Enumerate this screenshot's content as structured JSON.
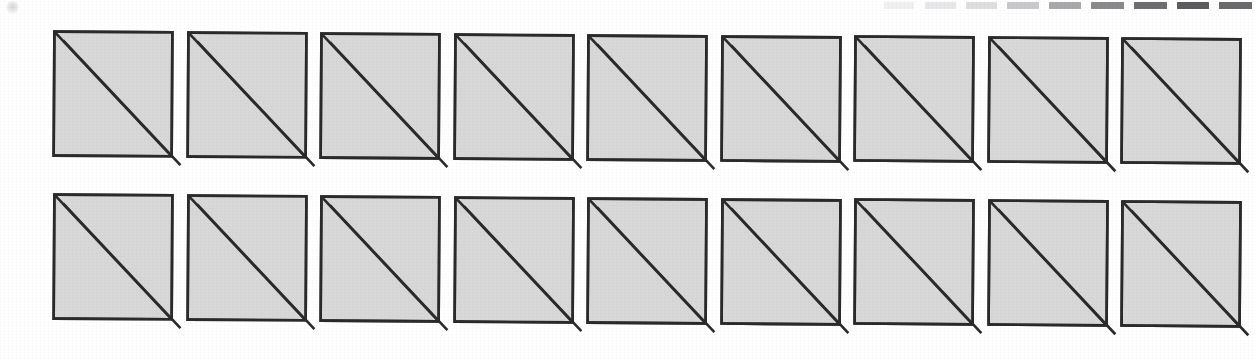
{
  "figure": {
    "background_color": "#ffffff",
    "width": 1255,
    "height": 359
  },
  "style": {
    "fill_color": "#d8d8d8",
    "stroke_color": "#2a2a2a",
    "band_color": "#ffffff",
    "stroke_width": 2.6,
    "band_width": 11
  },
  "grid": {
    "rows": 2,
    "columns": 9,
    "tile_count": 18,
    "tile_width": 118,
    "tile_height": 124,
    "column_pitch": 133.5,
    "row_top_offsets": [
      30,
      193
    ],
    "first_column_left": 52,
    "skew_per_column": 0.9,
    "skew_note": "Each successive tile sits fractionally lower and leans slightly, reproducing the page skew of the original scan."
  },
  "corner_mark": {
    "name": "registration-dot",
    "visible": true,
    "position": "top-left",
    "color": "#8e8e92"
  },
  "dash_strip": {
    "name": "tick-strip",
    "position": "top-right",
    "count": 10,
    "note": "Row of short horizontal dashes increasing in darkness toward the right edge.",
    "dashes": [
      {
        "left": 0,
        "width": 30,
        "color": "#f0f0f1"
      },
      {
        "left": 41,
        "width": 31,
        "color": "#e8e8ea"
      },
      {
        "left": 82,
        "width": 31,
        "color": "#dededf"
      },
      {
        "left": 123,
        "width": 32,
        "color": "#c9c9cb"
      },
      {
        "left": 165,
        "width": 32,
        "color": "#a9a9ab"
      },
      {
        "left": 207,
        "width": 33,
        "color": "#8a8a8d"
      },
      {
        "left": 250,
        "width": 33,
        "color": "#6e6e71"
      },
      {
        "left": 293,
        "width": 32,
        "color": "#5c5c5f"
      },
      {
        "left": 335,
        "width": 33,
        "color": "#6a6a6d"
      }
    ]
  },
  "tiles": {
    "row_1": [
      {
        "index": 1,
        "label": "tile-r1-c1"
      },
      {
        "index": 2,
        "label": "tile-r1-c2"
      },
      {
        "index": 3,
        "label": "tile-r1-c3"
      },
      {
        "index": 4,
        "label": "tile-r1-c4"
      },
      {
        "index": 5,
        "label": "tile-r1-c5"
      },
      {
        "index": 6,
        "label": "tile-r1-c6"
      },
      {
        "index": 7,
        "label": "tile-r1-c7"
      },
      {
        "index": 8,
        "label": "tile-r1-c8"
      },
      {
        "index": 9,
        "label": "tile-r1-c9"
      }
    ],
    "row_2": [
      {
        "index": 1,
        "label": "tile-r2-c1"
      },
      {
        "index": 2,
        "label": "tile-r2-c2"
      },
      {
        "index": 3,
        "label": "tile-r2-c3"
      },
      {
        "index": 4,
        "label": "tile-r2-c4"
      },
      {
        "index": 5,
        "label": "tile-r2-c5"
      },
      {
        "index": 6,
        "label": "tile-r2-c6"
      },
      {
        "index": 7,
        "label": "tile-r2-c7"
      },
      {
        "index": 8,
        "label": "tile-r2-c8"
      },
      {
        "index": 9,
        "label": "tile-r2-c9"
      }
    ]
  }
}
